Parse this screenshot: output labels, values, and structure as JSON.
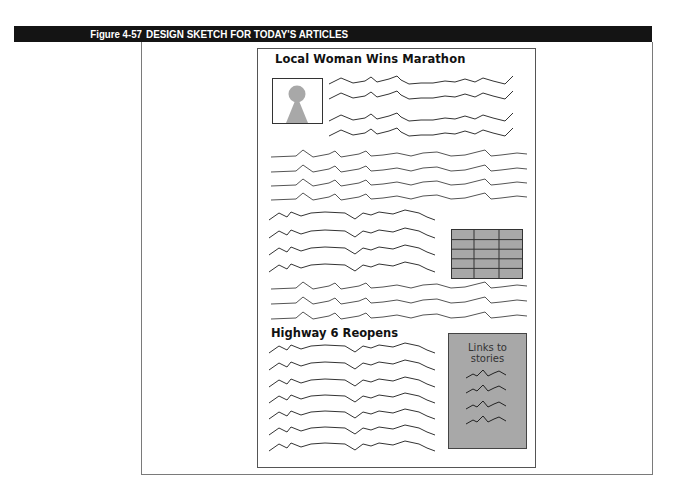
{
  "figure": {
    "label": "Figure 4-57",
    "title": "DESIGN SKETCH FOR TODAY'S ARTICLES",
    "header_bg": "#141414",
    "header_text_color": "#ffffff"
  },
  "sketch": {
    "article1": {
      "headline": "Local Woman Wins Marathon",
      "photo_icon": "person-silhouette-icon",
      "text_lines_beside_photo": 4,
      "full_width_lines": 4,
      "short_lines_beside_table": 4,
      "full_width_lines_after_table": 3,
      "table": {
        "rows": 5,
        "columns": 3,
        "fill": "#a8a8a8"
      }
    },
    "article2": {
      "headline": "Highway 6 Reopens",
      "text_lines": 7
    },
    "sidebar": {
      "label_line1": "Links to",
      "label_line2": "stories",
      "link_squiggles": 4,
      "fill": "#a8a8a8"
    }
  }
}
